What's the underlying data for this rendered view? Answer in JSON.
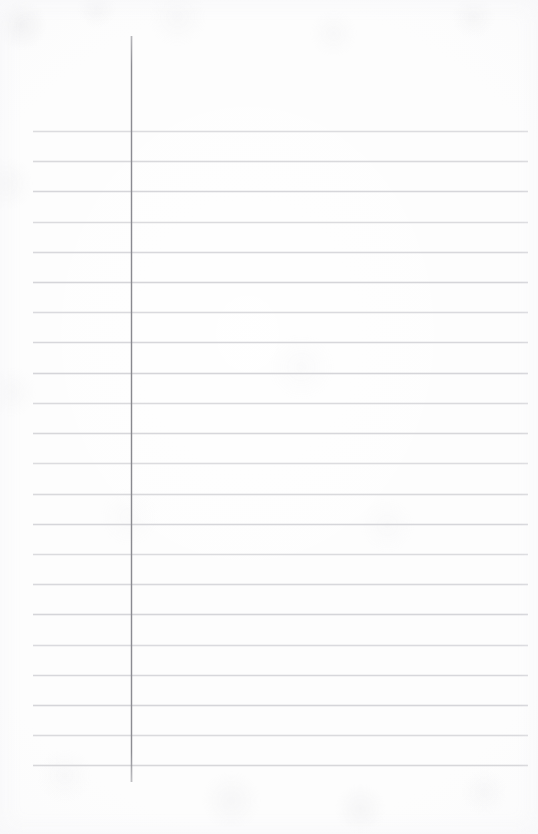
{
  "document": {
    "kind": "lined-notebook-paper",
    "title": "Blank ruled notebook page",
    "page_width": 538,
    "page_height": 834,
    "text_content": "",
    "is_blank": true
  },
  "colors": {
    "paper": "#fdfdfd",
    "paper_shade": "#f6f6f7",
    "ruled_line": "#d4d4d9",
    "margin_rule": "#8c8c93"
  },
  "ruling": {
    "horizontal_line_count": 22,
    "line_spacing_px": 30.2,
    "first_line_y": 131,
    "last_line_y": 765,
    "line_left_x": 33,
    "line_right_x": 528,
    "line_thickness_px": 1,
    "lines_y": [
      131,
      161,
      191,
      222,
      252,
      282,
      312,
      342,
      373,
      403,
      433,
      463,
      494,
      524,
      554,
      584,
      614,
      645,
      675,
      705,
      735,
      765
    ]
  },
  "margin": {
    "x": 131,
    "top_y": 36,
    "bottom_y": 782,
    "thickness_px": 1,
    "orientation": "vertical"
  }
}
